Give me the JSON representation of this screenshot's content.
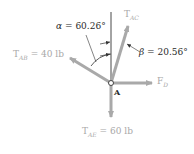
{
  "diagram": {
    "point": {
      "label": "A"
    },
    "angles": {
      "alpha": {
        "symbol": "α",
        "value": "60.26°",
        "text": "α = 60.26°"
      },
      "beta": {
        "symbol": "β",
        "value": "20.56°",
        "text": "β = 20.56°"
      }
    },
    "forces": {
      "t_ac": {
        "main": "T",
        "sub": "AC",
        "value": ""
      },
      "t_ab": {
        "main": "T",
        "sub": "AB",
        "value": " = 40 lb"
      },
      "f_d": {
        "main": "F",
        "sub": "D",
        "value": ""
      },
      "t_ae": {
        "main": "T",
        "sub": "AE",
        "value": " = 60 lb"
      }
    },
    "colors": {
      "arrow": "#a9a9a9",
      "line": "#333333",
      "force_label": "#a8a8a8",
      "angle_label": "#2a2a2a"
    }
  }
}
